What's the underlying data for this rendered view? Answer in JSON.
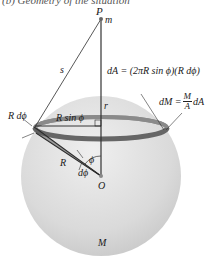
{
  "caption": "(b) Geometry of the situation",
  "labels": {
    "point_p": "P",
    "mass_m": "m",
    "distance_s": "s",
    "radius_r": "r",
    "ring_radius": "R sin ϕ",
    "ring_width": "R dϕ",
    "sphere_radius": "R",
    "angle_phi": "ϕ",
    "angle_dphi": "dϕ",
    "center_o": "O",
    "sphere_mass": "M"
  },
  "equations": {
    "dA_lhs": "dA = (2πR sin ϕ)(R dϕ)",
    "dM_lhs": "dM =",
    "dM_num": "M",
    "dM_den": "A",
    "dM_rhs": "dA"
  },
  "colors": {
    "sphere_fill": "#d9d9d9",
    "sphere_highlight": "#eeeeee",
    "ring": "#6e6e6e",
    "lines": "#333333",
    "text": "#1a1a1a"
  }
}
